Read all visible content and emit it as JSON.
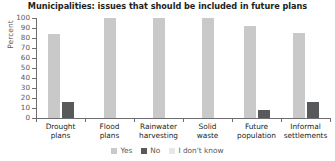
{
  "chart_data": {
    "type": "bar",
    "title": "Municipalities: issues that should be included in future plans",
    "xlabel": "",
    "ylabel": "Percent",
    "ylim": [
      0,
      100
    ],
    "yticks": [
      0,
      10,
      20,
      30,
      40,
      50,
      60,
      70,
      80,
      90,
      100
    ],
    "grid": false,
    "legend_position": "bottom-center",
    "categories": [
      "Drought plans",
      "Flood plans",
      "Rainwater harvesting",
      "Solid waste",
      "Future population",
      "Informal settlements"
    ],
    "category_lines": [
      [
        "Drought",
        "plans"
      ],
      [
        "Flood",
        "plans"
      ],
      [
        "Rainwater",
        "harvesting"
      ],
      [
        "Solid",
        "waste"
      ],
      [
        "Future",
        "population"
      ],
      [
        "Informal",
        "settlements"
      ]
    ],
    "series": [
      {
        "name": "Yes",
        "color": "#c9c9c9",
        "values": [
          84,
          100,
          100,
          100,
          92,
          85
        ]
      },
      {
        "name": "No",
        "color": "#58595b",
        "values": [
          16,
          0,
          0,
          0,
          8,
          16
        ]
      },
      {
        "name": "I don't know",
        "color": "#e8e8e8",
        "values": [
          0,
          0,
          0,
          0,
          0,
          0
        ]
      }
    ]
  },
  "legend": {
    "items": [
      {
        "label": "Yes",
        "color": "#c9c9c9"
      },
      {
        "label": "No",
        "color": "#58595b"
      },
      {
        "label": "I don't know",
        "color": "#e8e8e8"
      }
    ]
  },
  "axis": {
    "y_label": "Percent"
  }
}
